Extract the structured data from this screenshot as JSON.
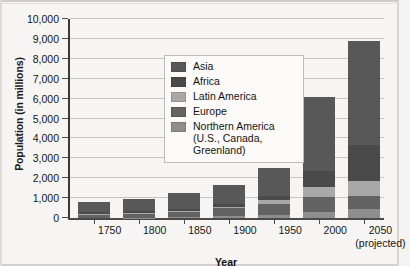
{
  "chart_data": {
    "type": "bar",
    "subtype": "stacked-vertical",
    "title": "",
    "xlabel": "Year",
    "ylabel": "Population (in millions)",
    "ylim": [
      0,
      10000
    ],
    "ytick_step": 1000,
    "grid": true,
    "legend_position": "inside-upper-left",
    "categories": [
      "1750",
      "1800",
      "1850",
      "1900",
      "1950",
      "2000",
      "2050"
    ],
    "category_sublabels": [
      "",
      "",
      "",
      "",
      "",
      "",
      "(projected)"
    ],
    "ytick_labels": [
      "0",
      "1,000",
      "2,000",
      "3,000",
      "4,000",
      "5,000",
      "6,000",
      "7,000",
      "8,000",
      "9,000",
      "10,000"
    ],
    "stack_order_bottom_to_top": [
      "Northern America",
      "Europe",
      "Latin America",
      "Africa",
      "Asia"
    ],
    "series": [
      {
        "name": "Northern America",
        "legend_label": "Northern America",
        "legend_label_continued": "(U.S., Canada,",
        "legend_label_continued2": "Greenland)",
        "color": "#8e8e8e",
        "values": [
          2,
          7,
          26,
          82,
          172,
          314,
          438
        ]
      },
      {
        "name": "Europe",
        "legend_label": "Europe",
        "color": "#636363",
        "values": [
          163,
          203,
          276,
          408,
          547,
          729,
          653
        ]
      },
      {
        "name": "Latin America",
        "legend_label": "Latin America",
        "color": "#a8a8a8",
        "values": [
          16,
          24,
          38,
          74,
          167,
          521,
          783
        ]
      },
      {
        "name": "Africa",
        "legend_label": "Africa",
        "color": "#4a4a4a",
        "values": [
          106,
          107,
          111,
          133,
          221,
          796,
          1803
        ]
      },
      {
        "name": "Asia",
        "legend_label": "Asia",
        "color": "#585858",
        "values": [
          502,
          635,
          809,
          947,
          1402,
          3700,
          5217
        ]
      }
    ],
    "totals": [
      789,
      976,
      1260,
      1644,
      2509,
      6060,
      8894
    ]
  },
  "axes": {
    "ylabel": "Population (in millions)",
    "xlabel": "Year"
  }
}
